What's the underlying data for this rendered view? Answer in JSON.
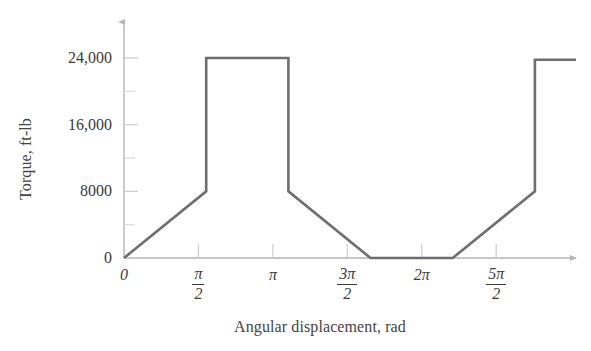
{
  "chart_data": {
    "type": "line",
    "title": "",
    "subtitle": "",
    "xlabel": "Angular displacement, rad",
    "ylabel": "Torque, ft-lb",
    "line_color": "#6e6e6e",
    "axis_color": "#b5b5b5",
    "grid": false,
    "legend": null,
    "xlim": [
      0,
      8.64
    ],
    "ylim": [
      0,
      26500
    ],
    "x_tick_values": [
      0,
      1.5707963,
      3.1415927,
      4.712389,
      6.2831853,
      7.8539816
    ],
    "x_tick_labels": [
      "0",
      "pi/2",
      "pi",
      "3pi/2",
      "2pi",
      "5pi/2"
    ],
    "y_tick_values": [
      0,
      8000,
      16000,
      24000
    ],
    "y_tick_labels": [
      "0",
      "8000",
      "16,000",
      "24,000"
    ],
    "y_minor_tick_values": [
      4000,
      12000,
      20000
    ],
    "x": [
      0,
      1.5707963,
      1.5707963,
      3.1415927,
      3.1415927,
      4.712389,
      6.2831853,
      7.8539816,
      7.8539816,
      8.64
    ],
    "y": [
      0,
      8000,
      24000,
      24000,
      8000,
      0,
      0,
      8000,
      23800,
      23800
    ],
    "series": [
      {
        "name": "Torque",
        "points": [
          {
            "x_label": "0",
            "x": 0,
            "y": 0
          },
          {
            "x_label": "pi/2",
            "x": 1.5707963,
            "y": 8000
          },
          {
            "x_label": "pi/2",
            "x": 1.5707963,
            "y": 24000
          },
          {
            "x_label": "pi",
            "x": 3.1415927,
            "y": 24000
          },
          {
            "x_label": "pi",
            "x": 3.1415927,
            "y": 8000
          },
          {
            "x_label": "3pi/2",
            "x": 4.712389,
            "y": 0
          },
          {
            "x_label": "2pi",
            "x": 6.2831853,
            "y": 0
          },
          {
            "x_label": "5pi/2",
            "x": 7.8539816,
            "y": 8000
          },
          {
            "x_label": "5pi/2",
            "x": 7.8539816,
            "y": 23800
          },
          {
            "x_label": "",
            "x": 8.64,
            "y": 23800
          }
        ]
      }
    ],
    "annotations": []
  },
  "axes": {
    "y_title": "Torque, ft-lb",
    "x_title": "Angular displacement, rad",
    "y_labels": {
      "t0": "0",
      "t1": "8000",
      "t2": "16,000",
      "t3": "24,000"
    },
    "x_labels": {
      "t0": "0",
      "t1_num": "π",
      "t1_den": "2",
      "t2": "π",
      "t3_num": "3π",
      "t3_den": "2",
      "t4": "2π",
      "t5_num": "5π",
      "t5_den": "2"
    }
  }
}
